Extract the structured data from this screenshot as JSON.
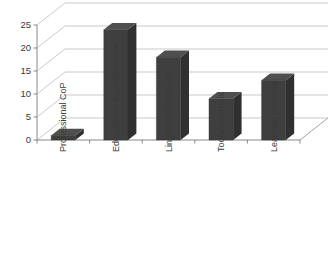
{
  "chart_data": {
    "type": "bar",
    "title": "",
    "subtitle": "",
    "xlabel": "",
    "ylabel": "",
    "categories": [
      "Professional CoP",
      "Educational theory/practice",
      "Linguistics/language",
      "Tools/materials",
      "Learning contexts"
    ],
    "values": [
      1,
      24,
      18,
      9,
      13
    ],
    "ylim": [
      0,
      25
    ],
    "yticks": [
      0,
      5,
      10,
      15,
      20,
      25
    ],
    "ytick_labels": [
      "0",
      "5",
      "10",
      "15",
      "20",
      "25"
    ],
    "grid": true,
    "legend": false,
    "legend_position": "none",
    "style": "3d-column",
    "colors": {
      "bar_front": "#3f3f3f",
      "bar_side": "#303030",
      "bar_top": "#4f4f4f",
      "gridline": "#b3b3b3",
      "axis": "#7a7a7a",
      "text": "#3a3a3a",
      "background": "#ffffff"
    }
  },
  "axis": {
    "y_ticks": [
      {
        "label": "25",
        "value": 25
      },
      {
        "label": "20",
        "value": 20
      },
      {
        "label": "15",
        "value": 15
      },
      {
        "label": "10",
        "value": 10
      },
      {
        "label": "5",
        "value": 5
      },
      {
        "label": "0",
        "value": 0
      }
    ]
  },
  "categories": [
    {
      "label": "Professional CoP"
    },
    {
      "label": "Educational theory/practice"
    },
    {
      "label": "Linguistics/language"
    },
    {
      "label": "Tools/materials"
    },
    {
      "label": "Learning contexts"
    }
  ]
}
